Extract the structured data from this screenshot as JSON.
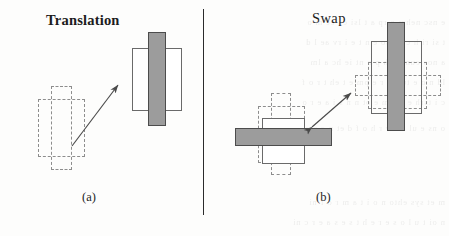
{
  "figure": {
    "background_color": "#fdfdfc",
    "ink_color": "#1c1c1c",
    "solid_fill_color": "#9c9c9c",
    "solid_stroke_color": "#4c4c4c",
    "outline_stroke_color": "#6a6a6a",
    "dashed_stroke_color": "#8d8d8d",
    "divider_color": "#2b2b2b"
  },
  "panels": [
    {
      "id": "a",
      "title": "Translation",
      "title_style": "bold",
      "caption": "(a)",
      "arrow": {
        "type": "single-headed",
        "direction": "up-right",
        "from": [
          72,
          146
        ],
        "to": [
          119,
          84
        ]
      },
      "before_state": {
        "style": "dashed",
        "label": "initial-configuration",
        "parts": [
          "vertical-bar",
          "horizontal-rect"
        ]
      },
      "after_state": {
        "style": "solid",
        "label": "translated-configuration",
        "parts": [
          "vertical-bar",
          "horizontal-rect"
        ]
      }
    },
    {
      "id": "b",
      "title": "Swap",
      "title_style": "regular",
      "caption": "(b)",
      "arrow": {
        "type": "double-headed",
        "direction": "diagonal",
        "from": [
          310,
          128
        ],
        "to": [
          352,
          92
        ]
      },
      "left_state": {
        "style": "solid-horizontal-with-dashed-vertical",
        "label": "horizontal-orientation",
        "parts": [
          "horizontal-bar",
          "vertical-rect",
          "dashed-vertical-bar",
          "dashed-horizontal-rect"
        ]
      },
      "right_state": {
        "style": "solid-vertical-with-dashed-horizontal",
        "label": "vertical-orientation",
        "parts": [
          "vertical-bar",
          "horizontal-rect",
          "dashed-horizontal-bar",
          "dashed-vertical-rect"
        ]
      }
    }
  ],
  "bleed_through_lines": [
    "e nsc nehm o rp a t lsi ca ee m o",
    "t si ri h c a pso e n t e i rv ae l d",
    "a nos eum ra h p o nt ie hc a lm",
    "ld n o e tu a s r e pm e t eh t r o f",
    "c i tsrh e a c m e ot n n s i a e r o",
    "o ns e ul am v r h o f d et n e s e r p",
    "m et sys ehto n o i t a m r o f ni",
    "n oi t u l o s e r e h t s e s a e r c ni"
  ]
}
